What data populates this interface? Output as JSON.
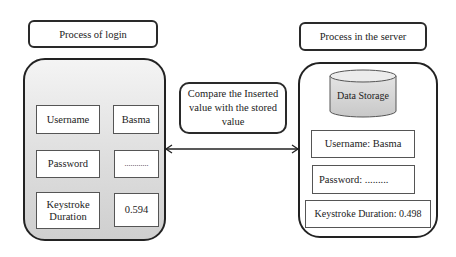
{
  "left": {
    "title": "Process of login",
    "fields": [
      {
        "label": "Username",
        "value": "Basma"
      },
      {
        "label": "Password",
        "value": "............"
      },
      {
        "label": "Keystroke Duration",
        "value": "0.594"
      }
    ]
  },
  "middle": {
    "compare_text": "Compare the Inserted value with the stored value",
    "arrow": "bidirectional"
  },
  "right": {
    "title": "Process in the server",
    "storage_label": "Data Storage",
    "records": [
      "Username: Basma",
      "Password: .........",
      "Keystroke Duration: 0.498"
    ]
  },
  "colors": {
    "border": "#222222",
    "left_fill_top": "#f4f4f4",
    "left_fill_bottom": "#cfcfcf",
    "cylinder_fill": "#d8d8d8"
  }
}
